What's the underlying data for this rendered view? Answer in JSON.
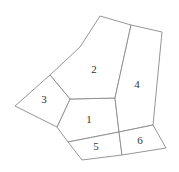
{
  "diagram": {
    "type": "partitioned-polygon-map",
    "colors": {
      "stroke": "#8a8a8a",
      "fill": "#ffffff",
      "label": "#333333"
    },
    "regions": [
      {
        "id": "1",
        "label": "1",
        "points": "70,99 115,98 119,132 68,142 57,127",
        "label_pos": [
          89,
          120
        ]
      },
      {
        "id": "2",
        "label": "2",
        "points": "100,16 131,25 115,98 70,99 50,75 80,47",
        "label_pos": [
          94,
          70
        ]
      },
      {
        "id": "3",
        "label": "3",
        "points": "50,75 70,99 57,127 15,106",
        "label_pos": [
          44,
          100
        ]
      },
      {
        "id": "4",
        "label": "4",
        "points": "131,25 162,32 153,125 119,132 115,98",
        "label_pos": [
          137,
          85
        ]
      },
      {
        "id": "5",
        "label": "5",
        "points": "68,142 119,132 122,155 82,160",
        "label_pos": [
          96,
          147
        ]
      },
      {
        "id": "6",
        "label": "6",
        "points": "119,132 153,125 166,148 122,155",
        "label_pos": [
          140,
          141
        ]
      }
    ]
  }
}
